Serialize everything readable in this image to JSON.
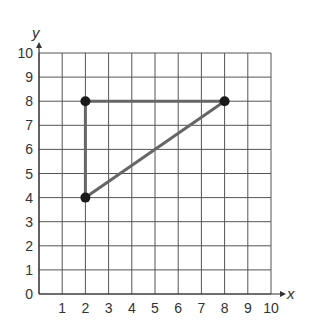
{
  "chart_data": {
    "type": "scatter",
    "title": "",
    "xlabel": "x",
    "ylabel": "y",
    "xlim": [
      0,
      10
    ],
    "ylim": [
      0,
      10
    ],
    "grid": true,
    "x_ticks": [
      "1",
      "2",
      "3",
      "4",
      "5",
      "6",
      "7",
      "8",
      "9",
      "10"
    ],
    "y_ticks": [
      "0",
      "1",
      "2",
      "3",
      "4",
      "5",
      "6",
      "7",
      "8",
      "9",
      "10"
    ],
    "points": [
      {
        "x": 2,
        "y": 8
      },
      {
        "x": 8,
        "y": 8
      },
      {
        "x": 2,
        "y": 4
      }
    ],
    "segments": [
      {
        "from": [
          2,
          8
        ],
        "to": [
          8,
          8
        ]
      },
      {
        "from": [
          2,
          8
        ],
        "to": [
          2,
          4
        ]
      },
      {
        "from": [
          2,
          4
        ],
        "to": [
          8,
          8
        ]
      }
    ],
    "shape": "triangle",
    "colors": {
      "grid": "#555555",
      "segment": "#666666",
      "point": "#1a1a1a"
    }
  }
}
